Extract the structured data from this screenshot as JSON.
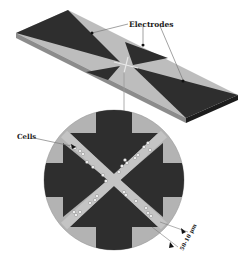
{
  "diagram": {
    "labels": {
      "electrodes": "Electrodes",
      "cells": "Cells",
      "gap_width": "50-10 μm"
    },
    "colors": {
      "electrode": "#2e2e2e",
      "substrate": "#bdbdbd",
      "substrate_edge": "#8c8c8c",
      "substrate_side_dark": "#1c1c1c",
      "cell": "#f2f2f2",
      "leader_line": "#7a7a7a",
      "background": "#ffffff"
    },
    "components": [
      "chip-substrate",
      "quadrupole-electrodes",
      "electrode-gap-center",
      "magnified-circular-view",
      "cross-shaped-channel",
      "cells"
    ]
  }
}
